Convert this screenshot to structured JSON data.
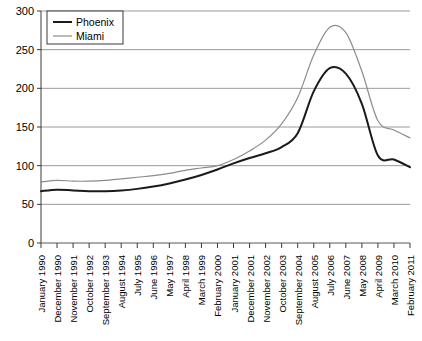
{
  "chart_data": {
    "type": "line",
    "title": "",
    "xlabel": "",
    "ylabel": "",
    "ylim": [
      0,
      300
    ],
    "yticks": [
      0,
      50,
      100,
      150,
      200,
      250,
      300
    ],
    "grid": true,
    "legend_position": "top-left",
    "categories": [
      "January 1990",
      "December 1990",
      "November 1991",
      "October 1992",
      "September 1993",
      "August 1994",
      "July 1995",
      "June 1996",
      "May 1997",
      "April 1998",
      "March 1999",
      "February 2000",
      "January 2001",
      "December 2001",
      "November 2002",
      "October 2003",
      "September 2004",
      "August 2005",
      "July 2006",
      "June 2007",
      "May 2008",
      "April 2009",
      "March 2010",
      "February 2011"
    ],
    "series": [
      {
        "name": "Phoenix",
        "color": "#1a1a1a",
        "width": 2,
        "values": [
          67,
          69,
          68,
          67,
          67,
          68,
          70,
          73,
          77,
          82,
          88,
          95,
          103,
          110,
          116,
          124,
          142,
          196,
          226,
          219,
          180,
          113,
          108,
          98
        ]
      },
      {
        "name": "Miami",
        "color": "#8c8c8c",
        "width": 1.2,
        "values": [
          79,
          81,
          80,
          80,
          81,
          83,
          85,
          87,
          90,
          94,
          97,
          100,
          108,
          119,
          133,
          154,
          188,
          243,
          279,
          272,
          222,
          158,
          146,
          136
        ]
      }
    ],
    "annotations": {
      "phoenix_peak_value": 226,
      "phoenix_peak_label": "July 2006",
      "miami_peak_value": 280,
      "miami_peak_label": "July 2006",
      "crossing_index_value": 100,
      "crossing_label": "February 2000"
    }
  },
  "legend": {
    "items": [
      {
        "label": "Phoenix"
      },
      {
        "label": "Miami"
      }
    ]
  }
}
